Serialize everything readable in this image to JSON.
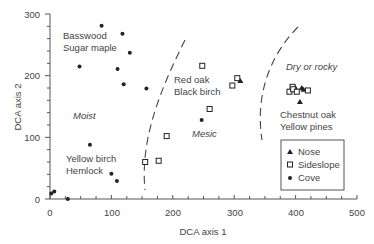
{
  "chart_data": {
    "type": "scatter",
    "title": "",
    "xlabel": "DCA axis 1",
    "ylabel": "DCA axis 2",
    "xlim": [
      0,
      500
    ],
    "ylim": [
      0,
      300
    ],
    "x_ticks": [
      0,
      100,
      200,
      300,
      400,
      500
    ],
    "y_ticks": [
      0,
      100,
      200,
      300
    ],
    "grid": false,
    "legend_position": "lower right",
    "series": [
      {
        "name": "Nose",
        "marker": "triangle",
        "points": [
          [
            310,
            192
          ],
          [
            410,
            181
          ],
          [
            413,
            178
          ],
          [
            407,
            158
          ],
          [
            399,
            182
          ]
        ]
      },
      {
        "name": "Sideslope",
        "marker": "square",
        "points": [
          [
            248,
            216
          ],
          [
            305,
            196
          ],
          [
            297,
            184
          ],
          [
            260,
            146
          ],
          [
            190,
            102
          ],
          [
            155,
            60
          ],
          [
            177,
            62
          ],
          [
            390,
            174
          ],
          [
            395,
            182
          ],
          [
            396,
            178
          ],
          [
            402,
            174
          ],
          [
            420,
            176
          ]
        ]
      },
      {
        "name": "Cove",
        "marker": "circle",
        "points": [
          [
            84,
            281
          ],
          [
            118,
            268
          ],
          [
            48,
            215
          ],
          [
            110,
            211
          ],
          [
            130,
            237
          ],
          [
            120,
            186
          ],
          [
            157,
            179
          ],
          [
            247,
            128
          ],
          [
            65,
            88
          ],
          [
            100,
            41
          ],
          [
            109,
            29
          ],
          [
            2,
            9
          ],
          [
            7,
            12
          ],
          [
            29,
            0
          ]
        ]
      }
    ],
    "annotations": [
      {
        "text": "Basswood",
        "style": "normal"
      },
      {
        "text": "Sugar maple",
        "style": "normal"
      },
      {
        "text": "Moist",
        "style": "italic"
      },
      {
        "text": "Yellow birch",
        "style": "normal"
      },
      {
        "text": "Hemlock",
        "style": "normal"
      },
      {
        "text": "Red oak",
        "style": "normal"
      },
      {
        "text": "Black birch",
        "style": "normal"
      },
      {
        "text": "Mesic",
        "style": "italic"
      },
      {
        "text": "Dry or rocky",
        "style": "italic"
      },
      {
        "text": "Chestnut oak",
        "style": "normal"
      },
      {
        "text": "Yellow pines",
        "style": "normal"
      }
    ],
    "boundaries": [
      "dashed curve separating Moist and Mesic",
      "dashed curve separating Mesic and Dry or rocky"
    ]
  },
  "labels": {
    "xlabel": "DCA axis 1",
    "ylabel": "DCA axis 2",
    "x_ticks": [
      "0",
      "100",
      "200",
      "300",
      "400",
      "500"
    ],
    "y_ticks": [
      "0",
      "100",
      "200",
      "300"
    ],
    "basswood": "Basswood",
    "sugar_maple": "Sugar maple",
    "moist": "Moist",
    "yellow_birch": "Yellow birch",
    "hemlock": "Hemlock",
    "red_oak": "Red oak",
    "black_birch": "Black birch",
    "mesic": "Mesic",
    "dry_rocky": "Dry or rocky",
    "chestnut_oak": "Chestnut oak",
    "yellow_pines": "Yellow pines",
    "legend": {
      "nose": "Nose",
      "sideslope": "Sideslope",
      "cove": "Cove"
    }
  }
}
